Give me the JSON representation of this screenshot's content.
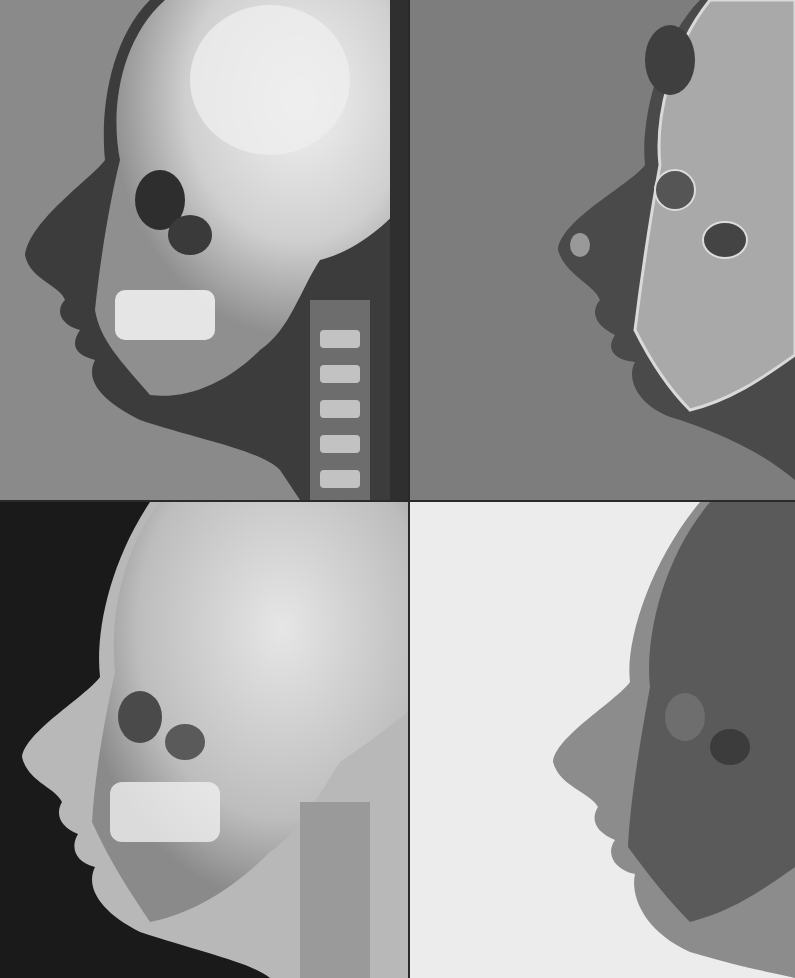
{
  "figure": {
    "layout": "2x2 grid",
    "panels": [
      {
        "id": "top-left",
        "rendering": "standard radiograph",
        "background": "#8a8a8a",
        "skull": "#e8e8e8",
        "soft_tissue": "#3c3c3c"
      },
      {
        "id": "top-right",
        "rendering": "edge/contour enhanced",
        "background": "#7d7d7d",
        "skull": "#a9a9a9",
        "soft_tissue": "#4a4a4a"
      },
      {
        "id": "bottom-left",
        "rendering": "bright bone on black background",
        "background": "#1a1a1a",
        "skull": "#dedede",
        "soft_tissue": "#b8b8b8"
      },
      {
        "id": "bottom-right",
        "rendering": "inverted on white background",
        "background": "#ececec",
        "skull": "#5a5a5a",
        "soft_tissue": "#8c8c8c"
      }
    ]
  }
}
